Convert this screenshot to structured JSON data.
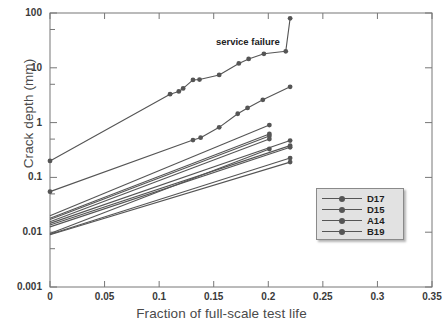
{
  "chart_data": {
    "type": "line",
    "title": "",
    "xlabel": "Fraction of full-scale test life",
    "ylabel": "Crack depth (mm)",
    "xlim": [
      0,
      0.35
    ],
    "ylim": [
      0.001,
      100
    ],
    "yscale": "log",
    "xscale": "linear",
    "grid": false,
    "xticks": [
      "0",
      "0.05",
      "0.1",
      "0.15",
      "0.2",
      "0.25",
      "0.3",
      "0.35"
    ],
    "xtick_values": [
      0,
      0.05,
      0.1,
      0.15,
      0.2,
      0.25,
      0.3,
      0.35
    ],
    "yticks": [
      "100",
      "10",
      "1",
      "0.1",
      "0.01",
      "0.001"
    ],
    "ytick_values": [
      100,
      10,
      1,
      0.1,
      0.01,
      0.001
    ],
    "legend_position": "lower-right",
    "legend_entries": [
      "D17",
      "D15",
      "A14",
      "B19"
    ],
    "series_color": "#555555",
    "marker": "circle",
    "annotations": [
      {
        "text": "service failure",
        "x": 0.152,
        "y": 30.0
      }
    ],
    "series": [
      {
        "name": "D17",
        "points": [
          [
            0.0,
            0.2
          ],
          [
            0.11,
            3.3
          ],
          [
            0.118,
            3.7
          ],
          [
            0.122,
            4.2
          ],
          [
            0.131,
            6.0
          ],
          [
            0.137,
            6.1
          ],
          [
            0.155,
            7.4
          ],
          [
            0.173,
            12.0
          ],
          [
            0.182,
            14.5
          ],
          [
            0.196,
            18.0
          ],
          [
            0.216,
            20.0
          ],
          [
            0.22,
            80.0
          ]
        ]
      },
      {
        "name": "D15",
        "points": [
          [
            0.0,
            0.055
          ],
          [
            0.131,
            0.48
          ],
          [
            0.138,
            0.53
          ],
          [
            0.155,
            0.82
          ],
          [
            0.172,
            1.45
          ],
          [
            0.181,
            1.85
          ],
          [
            0.195,
            2.6
          ],
          [
            0.22,
            4.5
          ]
        ]
      },
      {
        "name": "A14",
        "points": [
          [
            0.0,
            0.02
          ],
          [
            0.201,
            0.9
          ]
        ]
      },
      {
        "name": "B19",
        "points": [
          [
            0.0,
            0.018
          ],
          [
            0.201,
            0.62
          ]
        ]
      },
      {
        "name": "s5",
        "points": [
          [
            0.0,
            0.017
          ],
          [
            0.201,
            0.57
          ]
        ]
      },
      {
        "name": "s6",
        "points": [
          [
            0.0,
            0.0155
          ],
          [
            0.201,
            0.5
          ]
        ]
      },
      {
        "name": "s7",
        "points": [
          [
            0.0,
            0.0145
          ],
          [
            0.22,
            0.47
          ]
        ]
      },
      {
        "name": "s8",
        "points": [
          [
            0.0,
            0.0135
          ],
          [
            0.22,
            0.38
          ]
        ]
      },
      {
        "name": "s9",
        "points": [
          [
            0.0,
            0.0125
          ],
          [
            0.22,
            0.355
          ]
        ]
      },
      {
        "name": "s10",
        "points": [
          [
            0.0,
            0.0095
          ],
          [
            0.201,
            0.33
          ]
        ]
      },
      {
        "name": "s11",
        "points": [
          [
            0.0,
            0.0092
          ],
          [
            0.22,
            0.225
          ]
        ]
      },
      {
        "name": "s12",
        "points": [
          [
            0.0,
            0.009
          ],
          [
            0.22,
            0.19
          ]
        ]
      }
    ]
  },
  "figure": {
    "top_partial_text": ""
  }
}
